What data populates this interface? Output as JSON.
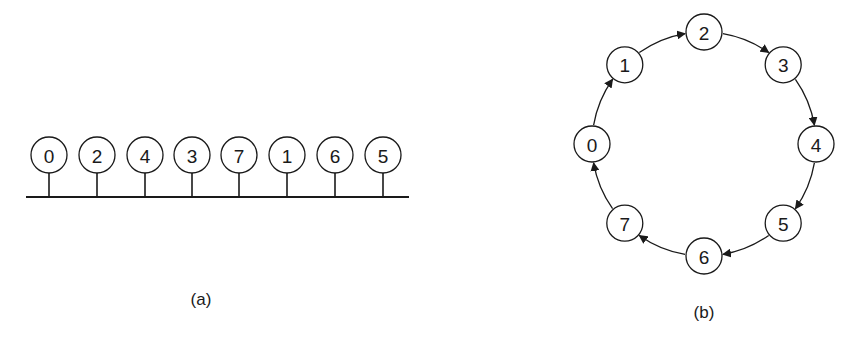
{
  "diagram_a": {
    "caption": "(a)",
    "type": "bus",
    "nodes": [
      "0",
      "2",
      "4",
      "3",
      "7",
      "1",
      "6",
      "5"
    ]
  },
  "diagram_b": {
    "caption": "(b)",
    "type": "directed-ring",
    "nodes": [
      "2",
      "3",
      "4",
      "5",
      "6",
      "7",
      "0",
      "1"
    ],
    "edges": [
      [
        "0",
        "1"
      ],
      [
        "1",
        "2"
      ],
      [
        "2",
        "3"
      ],
      [
        "3",
        "4"
      ],
      [
        "4",
        "5"
      ],
      [
        "5",
        "6"
      ],
      [
        "6",
        "7"
      ],
      [
        "7",
        "0"
      ]
    ]
  }
}
